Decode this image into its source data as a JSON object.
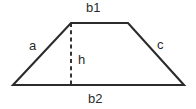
{
  "figure": {
    "name": "trapezoid-diagram",
    "shape": "trapezoid",
    "background_color": "#ffffff",
    "stroke_color": "#2b2b2b",
    "label_color": "#2b2b2b",
    "canvas": {
      "width": 196,
      "height": 109
    },
    "vertices": {
      "bottom_left": {
        "x": 13,
        "y": 85
      },
      "top_left": {
        "x": 71,
        "y": 23
      },
      "top_right": {
        "x": 128,
        "y": 23
      },
      "bottom_right": {
        "x": 184,
        "y": 85
      }
    },
    "outline_path": "M 13 85 L 71 23 L 128 23 L 184 85 Z",
    "height_line": {
      "name": "height-dashed-line",
      "x": 71,
      "y_top": 23,
      "y_bottom": 85,
      "style": "dashed"
    },
    "labels": {
      "top_base": "b1",
      "bottom_base": "b2",
      "left_leg": "a",
      "right_leg": "c",
      "height": "h"
    }
  }
}
